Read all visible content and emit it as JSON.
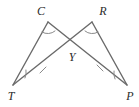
{
  "figure": {
    "background_color": "#ffffff",
    "stroke_color": "#6a6a6a",
    "mark_color": "#8a8a8a",
    "label_color": "#2b2b2b",
    "width": 139,
    "height": 107
  },
  "points": {
    "T": {
      "label": "T",
      "x": 13,
      "y": 85,
      "label_x": 11,
      "label_y": 97
    },
    "C": {
      "label": "C",
      "x": 48,
      "y": 22,
      "label_x": 41,
      "label_y": 12
    },
    "R": {
      "label": "R",
      "x": 92,
      "y": 22,
      "label_x": 103,
      "label_y": 12
    },
    "P": {
      "label": "P",
      "x": 127,
      "y": 85,
      "label_x": 130,
      "label_y": 97
    },
    "Y": {
      "label": "Y",
      "x": 70,
      "y": 47,
      "label_x": 72,
      "label_y": 58
    }
  },
  "segments": [
    {
      "name": "segment-T-C",
      "from": "T",
      "to": "C",
      "d": "M 13 85 L 48 22"
    },
    {
      "name": "segment-C-P",
      "from": "C",
      "to": "P",
      "d": "M 48 22 L 127 85"
    },
    {
      "name": "segment-T-R",
      "from": "T",
      "to": "R",
      "d": "M 13 85 L 92 22"
    },
    {
      "name": "segment-R-P",
      "from": "R",
      "to": "P",
      "d": "M 92 22 L 127 85"
    }
  ],
  "angle_arcs": [
    {
      "name": "angle-arc-C",
      "d": "M 42 32 A 11 11 0 0 0 55 31"
    },
    {
      "name": "angle-arc-R",
      "d": "M 85 31 A 11 11 0 0 0 98 32"
    },
    {
      "name": "angle-arc-T",
      "d": "M 25 78 A 14 14 0 0 0 26 70"
    },
    {
      "name": "angle-arc-P",
      "d": "M 114 71 A 14 14 0 0 0 115 79"
    }
  ],
  "tick_marks": [
    {
      "name": "tick-mark-TY",
      "d": "M 40 73 L 46 67"
    },
    {
      "name": "tick-mark-YP",
      "d": "M 97 65 L 103 71"
    }
  ]
}
